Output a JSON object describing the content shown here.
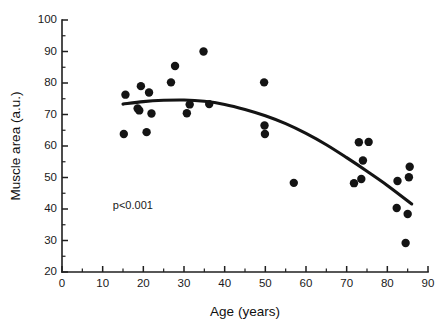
{
  "figure": {
    "background_color": "#ffffff",
    "foreground_color": "#141414"
  },
  "chart_data": {
    "type": "scatter",
    "title": "",
    "subtitle": "",
    "xlabel": "Age (years)",
    "ylabel": "Muscle area (a.u.)",
    "xlim": [
      0,
      90
    ],
    "ylim": [
      20,
      100
    ],
    "x_ticks": [
      0,
      10,
      20,
      30,
      40,
      50,
      60,
      70,
      80,
      90
    ],
    "y_ticks": [
      20,
      30,
      40,
      50,
      60,
      70,
      80,
      90,
      100
    ],
    "x_tick_labels": [
      "0",
      "10",
      "20",
      "30",
      "40",
      "50",
      "60",
      "70",
      "80",
      "90"
    ],
    "y_tick_labels": [
      "20",
      "30",
      "40",
      "50",
      "60",
      "70",
      "80",
      "90",
      "100"
    ],
    "x_minor_tick_step": 5,
    "y_minor_tick_step": 5,
    "grid": false,
    "legend": null,
    "marker": {
      "shape": "circle",
      "color": "#141414",
      "size_px": 5.2
    },
    "points": [
      {
        "x": 15.2,
        "y": 63.8
      },
      {
        "x": 15.6,
        "y": 76.3
      },
      {
        "x": 18.6,
        "y": 71.9
      },
      {
        "x": 19.0,
        "y": 71.3
      },
      {
        "x": 19.4,
        "y": 79.0
      },
      {
        "x": 20.8,
        "y": 64.4
      },
      {
        "x": 21.4,
        "y": 77.0
      },
      {
        "x": 22.0,
        "y": 70.3
      },
      {
        "x": 26.8,
        "y": 80.2
      },
      {
        "x": 27.8,
        "y": 85.4
      },
      {
        "x": 30.7,
        "y": 70.4
      },
      {
        "x": 31.4,
        "y": 73.2
      },
      {
        "x": 34.8,
        "y": 90.0
      },
      {
        "x": 36.2,
        "y": 73.3
      },
      {
        "x": 49.7,
        "y": 80.2
      },
      {
        "x": 49.8,
        "y": 66.5
      },
      {
        "x": 49.9,
        "y": 63.8
      },
      {
        "x": 57.0,
        "y": 48.3
      },
      {
        "x": 71.8,
        "y": 48.2
      },
      {
        "x": 73.0,
        "y": 61.2
      },
      {
        "x": 73.6,
        "y": 49.5
      },
      {
        "x": 74.0,
        "y": 55.4
      },
      {
        "x": 75.4,
        "y": 61.3
      },
      {
        "x": 82.3,
        "y": 40.3
      },
      {
        "x": 82.5,
        "y": 48.9
      },
      {
        "x": 84.5,
        "y": 29.2
      },
      {
        "x": 85.0,
        "y": 38.4
      },
      {
        "x": 85.3,
        "y": 50.1
      },
      {
        "x": 85.5,
        "y": 53.4
      }
    ],
    "fit_curve": {
      "type": "quadratic-regression",
      "color": "#141414",
      "line_width_px": 3.1,
      "x_start": 15.0,
      "x_end": 86.0,
      "points": [
        {
          "x": 15.0,
          "y": 73.3
        },
        {
          "x": 20.0,
          "y": 74.1
        },
        {
          "x": 25.0,
          "y": 74.5
        },
        {
          "x": 30.0,
          "y": 74.6
        },
        {
          "x": 35.0,
          "y": 74.2
        },
        {
          "x": 40.0,
          "y": 73.2
        },
        {
          "x": 45.0,
          "y": 71.6
        },
        {
          "x": 50.0,
          "y": 69.6
        },
        {
          "x": 55.0,
          "y": 67.1
        },
        {
          "x": 60.0,
          "y": 64.0
        },
        {
          "x": 65.0,
          "y": 60.4
        },
        {
          "x": 70.0,
          "y": 56.3
        },
        {
          "x": 75.0,
          "y": 52.0
        },
        {
          "x": 80.0,
          "y": 47.5
        },
        {
          "x": 86.0,
          "y": 41.6
        }
      ]
    },
    "annotations": [
      {
        "text": "p<0.001",
        "x": 12.5,
        "y": 40.0
      }
    ]
  }
}
